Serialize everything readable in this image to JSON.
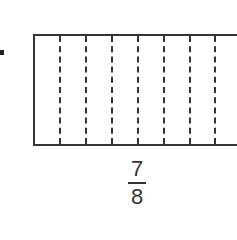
{
  "diagram": {
    "type": "fraction-bar-model",
    "partitions_visible": 8,
    "divider_count_visible": 7,
    "divider_x_positions": [
      59,
      85,
      111,
      137,
      163,
      189,
      214
    ],
    "fraction": {
      "numerator": "7",
      "denominator": "8"
    },
    "colors": {
      "stroke": "#333333",
      "background": "#ffffff"
    }
  }
}
